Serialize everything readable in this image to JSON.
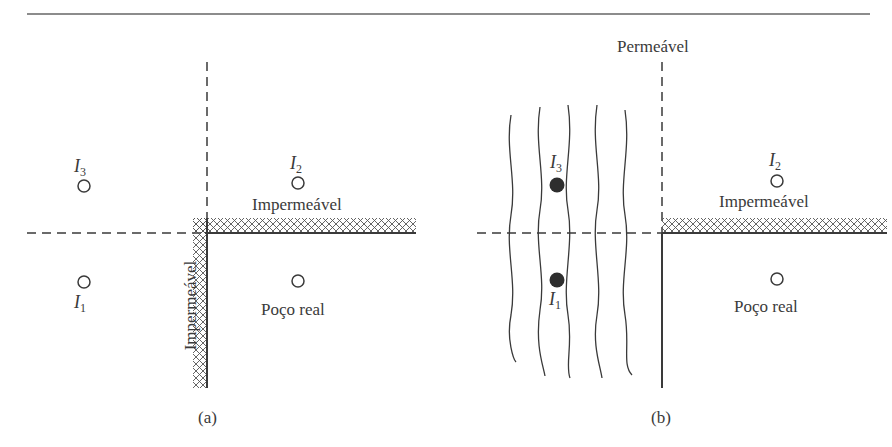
{
  "figure": {
    "panels": [
      {
        "id": "a",
        "caption": "(a)",
        "boundaries": [
          {
            "orientation": "horizontal",
            "type": "impermeable",
            "label": "Impermeável"
          },
          {
            "orientation": "vertical",
            "type": "impermeable",
            "label": "Impermeável"
          }
        ],
        "wells": [
          {
            "name": "I",
            "sub": "3",
            "kind": "image",
            "symbol": "open-circle"
          },
          {
            "name": "I",
            "sub": "2",
            "kind": "image",
            "symbol": "open-circle"
          },
          {
            "name": "I",
            "sub": "1",
            "kind": "image",
            "symbol": "open-circle"
          },
          {
            "name": "Poço real",
            "kind": "real",
            "symbol": "open-circle"
          }
        ]
      },
      {
        "id": "b",
        "caption": "(b)",
        "boundaries": [
          {
            "orientation": "vertical",
            "type": "permeable",
            "label": "Permeável"
          },
          {
            "orientation": "horizontal",
            "type": "impermeable",
            "label": "Impermeável"
          }
        ],
        "wells": [
          {
            "name": "I",
            "sub": "3",
            "kind": "image",
            "symbol": "filled-circle"
          },
          {
            "name": "I",
            "sub": "1",
            "kind": "image",
            "symbol": "filled-circle"
          },
          {
            "name": "I",
            "sub": "2",
            "kind": "image",
            "symbol": "open-circle"
          },
          {
            "name": "Poço real",
            "kind": "real",
            "symbol": "open-circle"
          }
        ],
        "wavy_lines": 5
      }
    ]
  },
  "labels": {
    "a_I3": "I",
    "a_I3_sub": "3",
    "a_I2": "I",
    "a_I2_sub": "2",
    "a_I1": "I",
    "a_I1_sub": "1",
    "a_imperm_h": "Impermeável",
    "a_imperm_v": "Impermeável",
    "a_real": "Poço real",
    "a_caption": "(a)",
    "b_perm": "Permeável",
    "b_I3": "I",
    "b_I3_sub": "3",
    "b_I1": "I",
    "b_I1_sub": "1",
    "b_I2": "I",
    "b_I2_sub": "2",
    "b_imperm_h": "Impermeável",
    "b_real": "Poço real",
    "b_caption": "(b)"
  },
  "colors": {
    "ink": "#3a3a3a",
    "rule": "#555555"
  }
}
